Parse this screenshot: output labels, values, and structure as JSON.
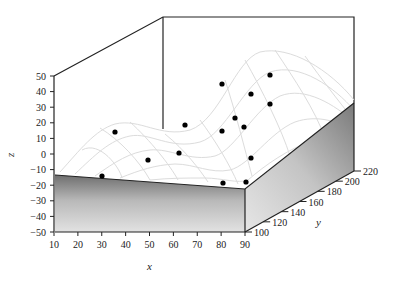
{
  "chart_data": {
    "type": "scatter3d",
    "title": "",
    "xlabel": "x",
    "ylabel": "y",
    "zlabel": "z",
    "xlim": [
      10,
      90
    ],
    "ylim": [
      100,
      220
    ],
    "zlim": [
      -50,
      50
    ],
    "x_ticks": [
      "10",
      "20",
      "30",
      "40",
      "50",
      "60",
      "70",
      "80",
      "90"
    ],
    "y_ticks": [
      "100",
      "120",
      "140",
      "160",
      "180",
      "200",
      "220"
    ],
    "z_ticks": [
      "50",
      "40",
      "30",
      "20",
      "10",
      "0",
      "-10",
      "-20",
      "-30",
      "-40",
      "-50"
    ],
    "surface": "fitted regression surface (light gray wireframe mesh)",
    "grid": false,
    "legend": null,
    "points_screen": [
      [
        222,
        84
      ],
      [
        270,
        75
      ],
      [
        251,
        94
      ],
      [
        270,
        104
      ],
      [
        235,
        118
      ],
      [
        244,
        127
      ],
      [
        185,
        125
      ],
      [
        222,
        131
      ],
      [
        115,
        132
      ],
      [
        179,
        153
      ],
      [
        148,
        160
      ],
      [
        251,
        158
      ],
      [
        102,
        176
      ],
      [
        223,
        183
      ],
      [
        246,
        182
      ]
    ],
    "point_count": 15
  },
  "axes": {
    "x_label": "x",
    "y_label": "y",
    "z_label": "z"
  }
}
